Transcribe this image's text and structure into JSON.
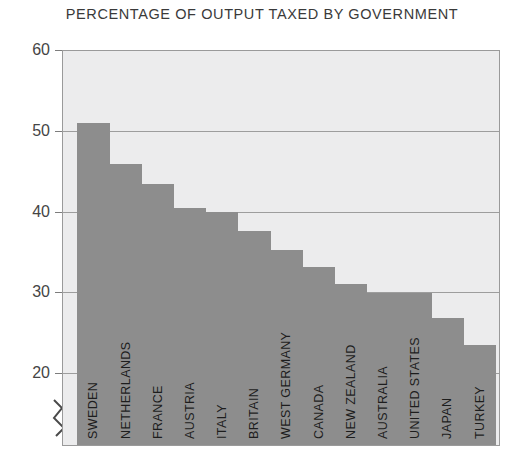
{
  "chart": {
    "title": "PERCENTAGE OF OUTPUT TAXED BY GOVERNMENT",
    "y_ticks": [
      "60",
      "50",
      "40",
      "30",
      "20"
    ],
    "accent_bar_color": "#8d8d8d",
    "plot_background": "#ececed",
    "gridline_color": "#9d9d9d"
  },
  "chart_data": {
    "type": "bar",
    "title": "PERCENTAGE OF OUTPUT TAXED BY GOVERNMENT",
    "xlabel": "",
    "ylabel": "",
    "ylim": [
      18,
      60
    ],
    "yticks": [
      20,
      30,
      40,
      50,
      60
    ],
    "grid": true,
    "legend": "none",
    "axis_break": true,
    "categories": [
      "SWEDEN",
      "NETHERLANDS",
      "FRANCE",
      "AUSTRIA",
      "ITALY",
      "BRITAIN",
      "WEST GERMANY",
      "CANADA",
      "NEW ZEALAND",
      "AUSTRALIA",
      "UNITED STATES",
      "JAPAN",
      "TURKEY"
    ],
    "values": [
      51,
      46,
      43.5,
      40.5,
      40,
      37.6,
      35.3,
      33.2,
      31,
      30,
      30,
      26.8,
      23.5
    ]
  }
}
